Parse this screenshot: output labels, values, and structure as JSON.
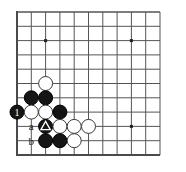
{
  "figure": {
    "kind": "go-board-diagram",
    "background_color": "#ffffff"
  },
  "board": {
    "line_color": "#555555",
    "edge_color": "#4a4a4a",
    "line_width": 1,
    "edge_width": 2,
    "grid_spacing": 14.3,
    "origin_x": 17,
    "origin_y": 12,
    "columns": 11,
    "rows": 11,
    "left_edge_visible": true,
    "top_edge_visible": true,
    "bottom_edge_visible": true,
    "right_edge_visible": false,
    "star_points": [
      {
        "col": 2,
        "row": 2
      },
      {
        "col": 8,
        "row": 2
      },
      {
        "col": 8,
        "row": 8
      }
    ],
    "star_point_color": "#222222",
    "star_point_size": 3
  },
  "stones": {
    "black_fill": "#151515",
    "black_stroke": "#000000",
    "white_fill": "#ffffff",
    "white_stroke": "#3a3a3a",
    "radius": 7,
    "list": [
      {
        "col": 2,
        "row": 5,
        "color": "white",
        "label": "",
        "marker": ""
      },
      {
        "col": 1,
        "row": 6,
        "color": "black",
        "label": "",
        "marker": ""
      },
      {
        "col": 2,
        "row": 6,
        "color": "black",
        "label": "",
        "marker": ""
      },
      {
        "col": 0,
        "row": 7,
        "color": "black",
        "label": "1",
        "marker": ""
      },
      {
        "col": 1,
        "row": 7,
        "color": "white",
        "label": "",
        "marker": ""
      },
      {
        "col": 2,
        "row": 7,
        "color": "white",
        "label": "",
        "marker": ""
      },
      {
        "col": 3,
        "row": 7,
        "color": "black",
        "label": "",
        "marker": ""
      },
      {
        "col": 2,
        "row": 8,
        "color": "black",
        "label": "",
        "marker": "triangle"
      },
      {
        "col": 3,
        "row": 8,
        "color": "white",
        "label": "",
        "marker": ""
      },
      {
        "col": 4,
        "row": 8,
        "color": "white",
        "label": "",
        "marker": ""
      },
      {
        "col": 5,
        "row": 8,
        "color": "white",
        "label": "",
        "marker": ""
      },
      {
        "col": 2,
        "row": 9,
        "color": "black",
        "label": "",
        "marker": ""
      },
      {
        "col": 3,
        "row": 9,
        "color": "black",
        "label": "",
        "marker": ""
      },
      {
        "col": 4,
        "row": 9,
        "color": "white",
        "label": "",
        "marker": ""
      }
    ]
  },
  "labels": {
    "text_color": "#1a1a1a",
    "font_size": 11,
    "list": [
      {
        "col": 1,
        "row": 8,
        "text": "a"
      },
      {
        "col": 1,
        "row": 9,
        "text": "b"
      }
    ]
  },
  "move_label": {
    "text": "1",
    "color": "#ffffff",
    "font_size": 10
  },
  "marker": {
    "type": "triangle",
    "color": "#ffffff"
  }
}
